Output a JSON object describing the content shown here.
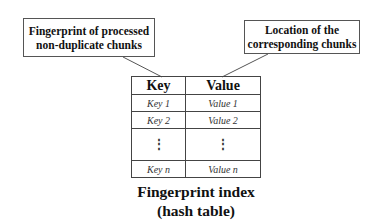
{
  "callouts": {
    "left": {
      "line1": "Fingerprint of processed",
      "line2": "non-duplicate chunks"
    },
    "right": {
      "line1": "Location of the",
      "line2": "corresponding chunks"
    }
  },
  "table": {
    "headers": [
      "Key",
      "Value"
    ],
    "rows": [
      [
        "Key 1",
        "Value 1"
      ],
      [
        "Key 2",
        "Value 2"
      ],
      [
        "⋮",
        "⋮"
      ],
      [
        "Key n",
        "Value n"
      ]
    ]
  },
  "caption": {
    "line1": "Fingerprint index",
    "line2": "(hash table)"
  }
}
